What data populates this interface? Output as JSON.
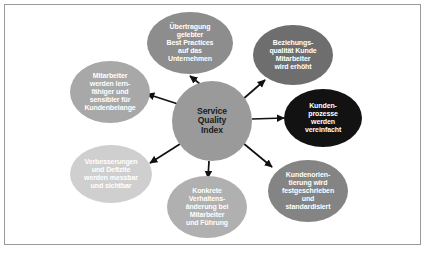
{
  "diagram": {
    "type": "hub-and-spoke",
    "title_visible": false,
    "frame_border_color": "#9a9a9a",
    "background_color": "#ffffff",
    "arrow_color": "#111111",
    "center": {
      "id": "service-quality-index",
      "label": "Service\nQuality\nIndex",
      "lines": [
        "Service",
        "Quality",
        "Index"
      ],
      "shape": "circle",
      "fill": "#9a9a9a",
      "text_color": "#1c1c1c",
      "cx": 212,
      "cy": 121,
      "rx": 40,
      "ry": 40,
      "font_size": 8.6
    },
    "nodes": [
      {
        "id": "best-practices",
        "label": "Übertragung gelebter Best Practices auf das Unternehmen",
        "lines": [
          "Übertragung",
          "gelebter",
          "Best Practices",
          "auf das",
          "Unternehmen"
        ],
        "shape": "ellipse",
        "fill": "#8d8d8d",
        "text_color": "#ffffff",
        "cx": 190,
        "cy": 43,
        "rx": 43,
        "ry": 31,
        "font_size": 7.0,
        "position": "top"
      },
      {
        "id": "beziehungsqualitaet",
        "label": "Beziehungsqualität Kunde Mitarbeiter wird erhöht",
        "lines": [
          "Beziehungs-",
          "qualität Kunde",
          "Mitarbeiter",
          "wird erhöht"
        ],
        "shape": "ellipse",
        "fill": "#6e6e6e",
        "text_color": "#ffffff",
        "cx": 293,
        "cy": 55,
        "rx": 40,
        "ry": 30,
        "font_size": 7.0,
        "position": "top-right"
      },
      {
        "id": "kundenprozesse",
        "label": "Kundenprozesse werden vereinfacht",
        "lines": [
          "Kunden-",
          "prozesse",
          "werden",
          "vereinfacht"
        ],
        "shape": "ellipse",
        "fill": "#121212",
        "text_color": "#ffffff",
        "cx": 323,
        "cy": 118,
        "rx": 39,
        "ry": 29,
        "font_size": 7.0,
        "position": "right"
      },
      {
        "id": "kundenorientierung",
        "label": "Kundenorientierung wird festgeschrieben und standardisiert",
        "lines": [
          "Kundenorien-",
          "tierung wird",
          "festgeschrieben",
          "und",
          "standardisiert"
        ],
        "shape": "ellipse",
        "fill": "#848484",
        "text_color": "#ffffff",
        "cx": 308,
        "cy": 191,
        "rx": 40,
        "ry": 31,
        "font_size": 7.0,
        "position": "bottom-right"
      },
      {
        "id": "verhaltensaenderung",
        "label": "Konkrete Verhaltensänderung bei Mitarbeiter und Führung",
        "lines": [
          "Konkrete",
          "Verhaltens-",
          "änderung bei",
          "Mitarbeiter",
          "und Führung"
        ],
        "shape": "ellipse",
        "fill": "#b0b0b0",
        "text_color": "#ffffff",
        "cx": 207,
        "cy": 207,
        "rx": 40,
        "ry": 31,
        "font_size": 7.0,
        "position": "bottom"
      },
      {
        "id": "verbesserungen-defizite",
        "label": "Verbesserungen und Defizite werden messbar und sichtbar",
        "lines": [
          "Verbesserungen",
          "und Defizite",
          "werden messbar",
          "und sichtbar"
        ],
        "shape": "ellipse",
        "fill": "#cfcfcf",
        "text_color": "#ffffff",
        "cx": 111,
        "cy": 174,
        "rx": 41,
        "ry": 29,
        "font_size": 7.0,
        "position": "bottom-left"
      },
      {
        "id": "mitarbeiter-lernfaehig",
        "label": "Mitarbeiter werden lernfähiger und sensibler für Kundenbelange",
        "lines": [
          "Mitarbeiter",
          "werden lern-",
          "fähiger und",
          "sensibler für",
          "Kundenbelange"
        ],
        "shape": "ellipse",
        "fill": "#a8a8a8",
        "text_color": "#ffffff",
        "cx": 110,
        "cy": 92,
        "rx": 40,
        "ry": 31,
        "font_size": 7.0,
        "position": "left"
      }
    ],
    "arrows": [
      {
        "id": "arrow-to-best-practices",
        "from": "service-quality-index",
        "to": "best-practices",
        "x1": 200,
        "y1": 84,
        "x2": 190,
        "y2": 76
      },
      {
        "id": "arrow-to-beziehungsqualitaet",
        "from": "service-quality-index",
        "to": "beziehungsqualitaet",
        "x1": 242,
        "y1": 100,
        "x2": 265,
        "y2": 80
      },
      {
        "id": "arrow-to-kundenprozesse",
        "from": "service-quality-index",
        "to": "kundenprozesse",
        "x1": 252,
        "y1": 119,
        "x2": 284,
        "y2": 118
      },
      {
        "id": "arrow-to-kundenorientierung",
        "from": "service-quality-index",
        "to": "kundenorientierung",
        "x1": 243,
        "y1": 143,
        "x2": 272,
        "y2": 167
      },
      {
        "id": "arrow-to-verhaltensaenderung",
        "from": "service-quality-index",
        "to": "verhaltensaenderung",
        "x1": 209,
        "y1": 161,
        "x2": 208,
        "y2": 178
      },
      {
        "id": "arrow-to-verbesserungen",
        "from": "service-quality-index",
        "to": "verbesserungen-defizite",
        "x1": 180,
        "y1": 144,
        "x2": 150,
        "y2": 163
      },
      {
        "id": "arrow-to-mitarbeiter",
        "from": "service-quality-index",
        "to": "mitarbeiter-lernfaehig",
        "x1": 178,
        "y1": 104,
        "x2": 147,
        "y2": 94
      }
    ]
  }
}
